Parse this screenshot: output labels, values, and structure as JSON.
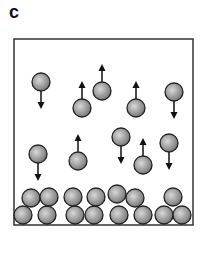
{
  "label": "c",
  "box": {
    "x": 14,
    "y": 39,
    "w": 179,
    "h": 186
  },
  "ball_radius": 9,
  "moving": [
    {
      "x": 41,
      "y": 82,
      "dir": "down"
    },
    {
      "x": 82,
      "y": 108,
      "dir": "up"
    },
    {
      "x": 102,
      "y": 91,
      "dir": "up"
    },
    {
      "x": 136,
      "y": 108,
      "dir": "up"
    },
    {
      "x": 174,
      "y": 92,
      "dir": "down"
    },
    {
      "x": 38,
      "y": 154,
      "dir": "down"
    },
    {
      "x": 78,
      "y": 161,
      "dir": "up"
    },
    {
      "x": 121,
      "y": 137,
      "dir": "down"
    },
    {
      "x": 143,
      "y": 165,
      "dir": "up"
    },
    {
      "x": 169,
      "y": 143,
      "dir": "down"
    }
  ],
  "settled": [
    [
      23,
      215
    ],
    [
      47,
      215
    ],
    [
      75,
      215
    ],
    [
      94,
      215
    ],
    [
      119,
      215
    ],
    [
      143,
      215
    ],
    [
      164,
      215
    ],
    [
      182,
      215
    ],
    [
      31,
      198
    ],
    [
      49,
      197
    ],
    [
      73,
      197
    ],
    [
      96,
      197
    ],
    [
      117,
      194
    ],
    [
      135,
      198
    ],
    [
      173,
      197
    ]
  ]
}
